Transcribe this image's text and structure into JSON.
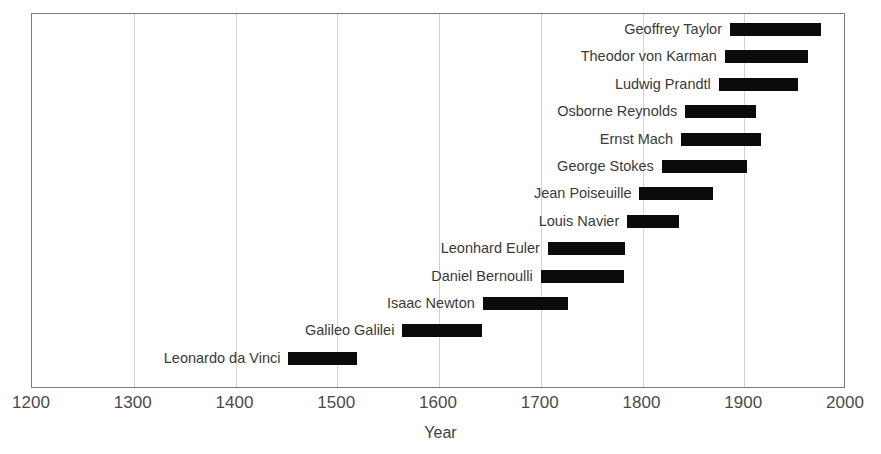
{
  "chart_data": {
    "type": "bar",
    "orientation": "horizontal",
    "title": "",
    "subtitle": "",
    "xlabel": "Year",
    "ylabel": "",
    "xlim": [
      1200,
      2000
    ],
    "xticks": [
      1200,
      1300,
      1400,
      1500,
      1600,
      1700,
      1800,
      1900,
      2000
    ],
    "xtick_labels": [
      "1200",
      "1300",
      "1400",
      "1500",
      "1600",
      "1700",
      "1800",
      "1900",
      "2000"
    ],
    "grid": "vertical",
    "legend": "none",
    "bar_color": "#0b0b0b",
    "categories": [
      "Geoffrey Taylor",
      "Theodor von Karman",
      "Ludwig Prandtl",
      "Osborne Reynolds",
      "Ernst Mach",
      "George Stokes",
      "Jean Poiseuille",
      "Louis Navier",
      "Leonhard Euler",
      "Daniel Bernoulli",
      "Isaac Newton",
      "Galileo Galilei",
      "Leonardo da Vinci"
    ],
    "bars": [
      {
        "label": "Geoffrey Taylor",
        "start": 1886,
        "end": 1975
      },
      {
        "label": "Theodor von Karman",
        "start": 1881,
        "end": 1963
      },
      {
        "label": "Ludwig Prandtl",
        "start": 1875,
        "end": 1953
      },
      {
        "label": "Osborne Reynolds",
        "start": 1842,
        "end": 1912
      },
      {
        "label": "Ernst Mach",
        "start": 1838,
        "end": 1916
      },
      {
        "label": "George Stokes",
        "start": 1819,
        "end": 1903
      },
      {
        "label": "Jean Poiseuille",
        "start": 1797,
        "end": 1869
      },
      {
        "label": "Louis Navier",
        "start": 1785,
        "end": 1836
      },
      {
        "label": "Leonhard Euler",
        "start": 1707,
        "end": 1783
      },
      {
        "label": "Daniel Bernoulli",
        "start": 1700,
        "end": 1782
      },
      {
        "label": "Isaac Newton",
        "start": 1643,
        "end": 1727
      },
      {
        "label": "Galileo Galilei",
        "start": 1564,
        "end": 1642
      },
      {
        "label": "Leonardo da Vinci",
        "start": 1452,
        "end": 1519
      }
    ]
  }
}
